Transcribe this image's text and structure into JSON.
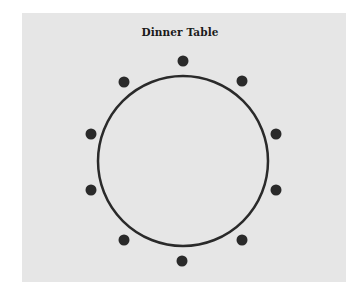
{
  "diagram": {
    "title": "Dinner Table",
    "background_color": "#e6e6e6",
    "ink_color": "#2a2a2a",
    "table": {
      "shape": "circle",
      "center": [
        183,
        161
      ],
      "radius": 85,
      "stroke_width": 2.5
    },
    "seats": [
      {
        "label": "seat-1",
        "x": 183,
        "y": 61
      },
      {
        "label": "seat-2",
        "x": 242,
        "y": 81
      },
      {
        "label": "seat-3",
        "x": 276,
        "y": 134
      },
      {
        "label": "seat-4",
        "x": 276,
        "y": 190
      },
      {
        "label": "seat-5",
        "x": 242,
        "y": 240
      },
      {
        "label": "seat-6",
        "x": 182,
        "y": 261
      },
      {
        "label": "seat-7",
        "x": 124,
        "y": 240
      },
      {
        "label": "seat-8",
        "x": 91,
        "y": 190
      },
      {
        "label": "seat-9",
        "x": 91,
        "y": 134
      },
      {
        "label": "seat-10",
        "x": 124,
        "y": 82
      }
    ],
    "seat_count": 10,
    "seat_radius": 5.5
  }
}
